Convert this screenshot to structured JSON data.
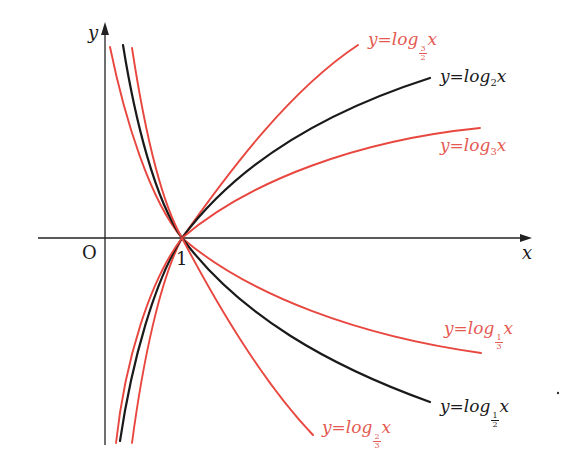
{
  "figure": {
    "axis_x_label": "x",
    "axis_y_label": "y",
    "origin_label": "O",
    "tick_one_label": "1"
  },
  "labels": {
    "log_3_2": {
      "prefix": "y=log",
      "base_num": "3",
      "base_den": "2",
      "suffix": "x"
    },
    "log_2": {
      "prefix": "y=log",
      "base": "2",
      "suffix": "x"
    },
    "log_3": {
      "prefix": "y=log",
      "base": "3",
      "suffix": "x"
    },
    "log_1_3": {
      "prefix": "y=log",
      "base_num": "1",
      "base_den": "3",
      "suffix": "x"
    },
    "log_1_2": {
      "prefix": "y=log",
      "base_num": "1",
      "base_den": "2",
      "suffix": "x"
    },
    "log_2_3": {
      "prefix": "y=log",
      "base_num": "2",
      "base_den": "3",
      "suffix": "x"
    }
  },
  "colors": {
    "red": "#e8473f",
    "red_text": "#e45a52",
    "black": "#1a1a1a",
    "axis": "#222222"
  },
  "chart_data": {
    "type": "line",
    "xlabel": "x",
    "ylabel": "y",
    "origin": "O",
    "x_ticks": [
      1
    ],
    "common_point": [
      1,
      0
    ],
    "series": [
      {
        "name": "y=log_{3/2} x",
        "base": 1.5,
        "color": "red",
        "direction": "increasing"
      },
      {
        "name": "y=log_2 x",
        "base": 2,
        "color": "black",
        "direction": "increasing"
      },
      {
        "name": "y=log_3 x",
        "base": 3,
        "color": "red",
        "direction": "increasing"
      },
      {
        "name": "y=log_{1/3} x",
        "base": 0.3333,
        "color": "red",
        "direction": "decreasing"
      },
      {
        "name": "y=log_{1/2} x",
        "base": 0.5,
        "color": "black",
        "direction": "decreasing"
      },
      {
        "name": "y=log_{2/3} x",
        "base": 0.6667,
        "color": "red",
        "direction": "decreasing"
      }
    ],
    "pixel_geometry": {
      "origin_px": [
        105,
        238
      ],
      "one_px": [
        182,
        238
      ],
      "x_axis": [
        [
          38,
          238
        ],
        [
          530,
          238
        ]
      ],
      "y_axis": [
        [
          105,
          445
        ],
        [
          105,
          22
        ]
      ],
      "curves": [
        {
          "id": "log_3_2",
          "color": "red",
          "d": "M110,47 C125,120 150,200 182,238 C230,170 290,90 358,45"
        },
        {
          "id": "log_2",
          "color": "black",
          "d": "M123,45 C135,120 155,200 182,238 C240,160 330,110 430,78"
        },
        {
          "id": "log_3",
          "color": "red",
          "d": "M132,48 C143,120 160,200 182,238 C250,180 360,140 480,128"
        },
        {
          "id": "log_1_3",
          "color": "red",
          "d": "M132,443 C143,360 160,280 182,238 C250,296 360,336 481,353"
        },
        {
          "id": "log_1_2",
          "color": "black",
          "d": "M120,441 C132,360 155,280 182,238 C240,316 330,366 430,402"
        },
        {
          "id": "log_2_3",
          "color": "red",
          "d": "M116,443 C125,360 150,280 182,238 C225,320 270,390 313,435"
        }
      ]
    }
  }
}
